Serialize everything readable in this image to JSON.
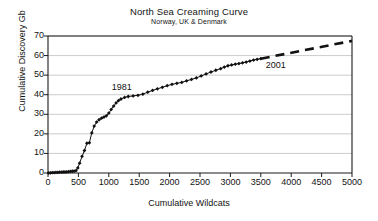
{
  "chart_data": {
    "type": "line",
    "title": "North Sea Creaming Curve",
    "subtitle": "Norway, UK & Denmark",
    "xlabel": "Cumulative Wildcats",
    "ylabel": "Cumulative Discovery Gb",
    "xlim": [
      0,
      5000
    ],
    "ylim": [
      0,
      70
    ],
    "xticks": [
      0,
      500,
      1000,
      1500,
      2000,
      2500,
      3000,
      3500,
      4000,
      4500,
      5000
    ],
    "yticks": [
      0,
      10,
      20,
      30,
      40,
      50,
      60,
      70
    ],
    "grid": "horizontal",
    "legend": "none",
    "marker": "diamond",
    "series": [
      {
        "name": "Cumulative discovery (historic)",
        "style": "solid-with-markers",
        "points": [
          [
            10,
            0.0
          ],
          [
            40,
            0.1
          ],
          [
            70,
            0.2
          ],
          [
            100,
            0.2
          ],
          [
            130,
            0.3
          ],
          [
            160,
            0.3
          ],
          [
            190,
            0.4
          ],
          [
            220,
            0.4
          ],
          [
            250,
            0.5
          ],
          [
            280,
            0.5
          ],
          [
            310,
            0.6
          ],
          [
            340,
            0.7
          ],
          [
            370,
            0.8
          ],
          [
            400,
            0.9
          ],
          [
            430,
            1.0
          ],
          [
            460,
            1.2
          ],
          [
            490,
            2.6
          ],
          [
            520,
            5.0
          ],
          [
            560,
            8.5
          ],
          [
            600,
            11.5
          ],
          [
            640,
            15.2
          ],
          [
            680,
            15.4
          ],
          [
            720,
            20.5
          ],
          [
            760,
            24.0
          ],
          [
            800,
            26.0
          ],
          [
            840,
            27.2
          ],
          [
            880,
            28.0
          ],
          [
            920,
            28.6
          ],
          [
            960,
            29.2
          ],
          [
            1000,
            30.6
          ],
          [
            1040,
            32.5
          ],
          [
            1080,
            34.2
          ],
          [
            1120,
            35.8
          ],
          [
            1160,
            37.0
          ],
          [
            1200,
            37.8
          ],
          [
            1260,
            38.6
          ],
          [
            1320,
            39.1
          ],
          [
            1400,
            39.4
          ],
          [
            1480,
            39.7
          ],
          [
            1560,
            40.3
          ],
          [
            1640,
            41.3
          ],
          [
            1720,
            42.2
          ],
          [
            1800,
            43.0
          ],
          [
            1880,
            43.8
          ],
          [
            1960,
            44.6
          ],
          [
            2040,
            45.3
          ],
          [
            2120,
            45.8
          ],
          [
            2200,
            46.3
          ],
          [
            2280,
            47.1
          ],
          [
            2360,
            47.8
          ],
          [
            2440,
            48.6
          ],
          [
            2520,
            49.6
          ],
          [
            2600,
            50.6
          ],
          [
            2680,
            51.6
          ],
          [
            2760,
            52.5
          ],
          [
            2840,
            53.3
          ],
          [
            2900,
            54.1
          ],
          [
            2960,
            54.8
          ],
          [
            3020,
            55.2
          ],
          [
            3080,
            55.6
          ],
          [
            3140,
            55.9
          ],
          [
            3200,
            56.3
          ],
          [
            3260,
            56.7
          ],
          [
            3320,
            57.2
          ],
          [
            3380,
            57.7
          ],
          [
            3440,
            58.1
          ],
          [
            3500,
            58.4
          ]
        ]
      },
      {
        "name": "Extrapolation",
        "style": "dashed",
        "points": [
          [
            3500,
            58.4
          ],
          [
            5000,
            67.5
          ]
        ]
      }
    ],
    "annotations": [
      {
        "text": "1981",
        "x": 1050,
        "y": 43.5
      },
      {
        "text": "2001",
        "x": 3580,
        "y": 54.5
      }
    ]
  }
}
